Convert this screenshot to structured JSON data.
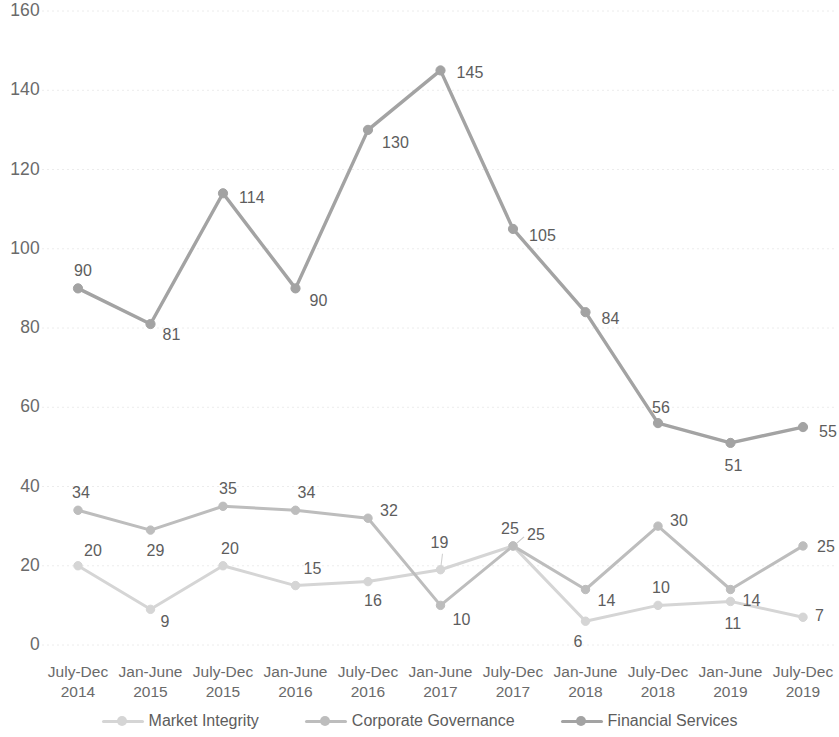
{
  "chart_data": {
    "type": "line",
    "title": "",
    "xlabel": "",
    "ylabel": "",
    "ylim": [
      0,
      160
    ],
    "ytick_step": 20,
    "yticks": [
      0,
      20,
      40,
      60,
      80,
      100,
      120,
      140,
      160
    ],
    "grid": true,
    "grid_style": "dotted horizontal",
    "legend_position": "bottom",
    "categories": [
      {
        "line1": "July-Dec",
        "line2": "2014"
      },
      {
        "line1": "Jan-June",
        "line2": "2015"
      },
      {
        "line1": "July-Dec",
        "line2": "2015"
      },
      {
        "line1": "Jan-June",
        "line2": "2016"
      },
      {
        "line1": "July-Dec",
        "line2": "2016"
      },
      {
        "line1": "Jan-June",
        "line2": "2017"
      },
      {
        "line1": "July-Dec",
        "line2": "2017"
      },
      {
        "line1": "Jan-June",
        "line2": "2018"
      },
      {
        "line1": "July-Dec",
        "line2": "2018"
      },
      {
        "line1": "Jan-June",
        "line2": "2019"
      },
      {
        "line1": "July-Dec",
        "line2": "2019"
      }
    ],
    "series": [
      {
        "name": "Market Integrity",
        "color": "#d5d5d5",
        "values": [
          20,
          9,
          20,
          15,
          16,
          19,
          25,
          6,
          10,
          11,
          7
        ],
        "label_offsets": [
          {
            "dx": 6,
            "dy": -24
          },
          {
            "dx": 10,
            "dy": 4
          },
          {
            "dx": -2,
            "dy": -26
          },
          {
            "dx": 8,
            "dy": -26
          },
          {
            "dx": -4,
            "dy": 10
          },
          {
            "dx": -10,
            "dy": -36
          },
          {
            "dx": -12,
            "dy": -26
          },
          {
            "dx": -12,
            "dy": 12
          },
          {
            "dx": -6,
            "dy": -26
          },
          {
            "dx": -6,
            "dy": 14
          },
          {
            "dx": 12,
            "dy": -10
          }
        ],
        "leader_lines": [
          5
        ]
      },
      {
        "name": "Corporate Governance",
        "color": "#bdbdbd",
        "values": [
          34,
          29,
          35,
          34,
          32,
          10,
          25,
          14,
          30,
          14,
          25
        ],
        "label_offsets": [
          {
            "dx": -6,
            "dy": -26
          },
          {
            "dx": -4,
            "dy": 12
          },
          {
            "dx": -4,
            "dy": -26
          },
          {
            "dx": 2,
            "dy": -26
          },
          {
            "dx": 12,
            "dy": -16
          },
          {
            "dx": 12,
            "dy": 6
          },
          {
            "dx": 14,
            "dy": -20
          },
          {
            "dx": 12,
            "dy": 2
          },
          {
            "dx": 12,
            "dy": -14
          },
          {
            "dx": 12,
            "dy": 2
          },
          {
            "dx": 14,
            "dy": -8
          }
        ],
        "leader_lines": []
      },
      {
        "name": "Financial Services",
        "color": "#a3a3a3",
        "values": [
          90,
          81,
          114,
          90,
          130,
          145,
          105,
          84,
          56,
          51,
          55
        ],
        "label_offsets": [
          {
            "dx": -4,
            "dy": -26
          },
          {
            "dx": 12,
            "dy": 2
          },
          {
            "dx": 16,
            "dy": -4
          },
          {
            "dx": 14,
            "dy": 4
          },
          {
            "dx": 14,
            "dy": 4
          },
          {
            "dx": 16,
            "dy": -6
          },
          {
            "dx": 16,
            "dy": -2
          },
          {
            "dx": 16,
            "dy": -2
          },
          {
            "dx": -6,
            "dy": -24
          },
          {
            "dx": -6,
            "dy": 14
          },
          {
            "dx": 16,
            "dy": -4
          }
        ],
        "leader_lines": []
      }
    ]
  },
  "legend": {
    "items": [
      {
        "label": "Market Integrity",
        "color": "#d5d5d5"
      },
      {
        "label": "Corporate Governance",
        "color": "#bdbdbd"
      },
      {
        "label": "Financial Services",
        "color": "#a3a3a3"
      }
    ]
  },
  "axes": {
    "gridline_color": "#ececec",
    "tick_text_color": "#6a6a6a"
  }
}
